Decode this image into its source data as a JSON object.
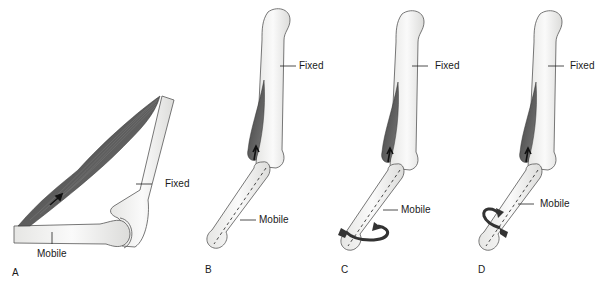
{
  "figure": {
    "panels": [
      {
        "id": "A",
        "letter": "A",
        "fixed_label": "Fixed",
        "mobile_label": "Mobile",
        "rotation": "none"
      },
      {
        "id": "B",
        "letter": "B",
        "fixed_label": "Fixed",
        "mobile_label": "Mobile",
        "rotation": "none"
      },
      {
        "id": "C",
        "letter": "C",
        "fixed_label": "Fixed",
        "mobile_label": "Mobile",
        "rotation": "counterclockwise-around-long-axis"
      },
      {
        "id": "D",
        "letter": "D",
        "fixed_label": "Fixed",
        "mobile_label": "Mobile",
        "rotation": "clockwise-around-long-axis"
      }
    ],
    "colors": {
      "bone_fill": "#f4f4f2",
      "bone_stroke": "#555555",
      "muscle": "#5a5a5a",
      "arrow": "#1a1a1a",
      "text": "#1a1a1a"
    }
  }
}
